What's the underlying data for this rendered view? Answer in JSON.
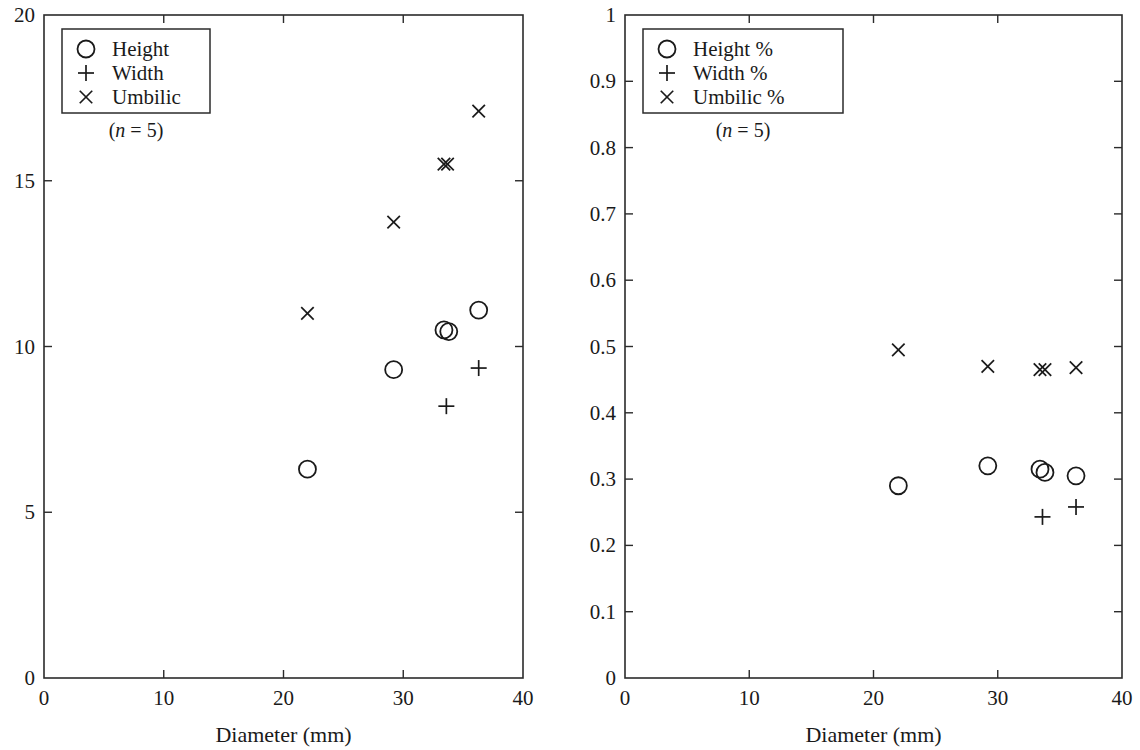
{
  "figure": {
    "background": "#ffffff",
    "ink_color": "#1a1a1a",
    "panel_count": 2
  },
  "chart_data": [
    {
      "panel": "left",
      "type": "scatter",
      "title": "",
      "xlabel": "Diameter (mm)",
      "ylabel": "",
      "xlim": [
        0,
        40
      ],
      "ylim": [
        0,
        20
      ],
      "xticks": [
        0,
        10,
        20,
        30,
        40
      ],
      "xticklabels": [
        "0",
        "10",
        "20",
        "30",
        "40"
      ],
      "yticks": [
        0,
        5,
        10,
        15,
        20
      ],
      "yticklabels": [
        "0",
        "5",
        "10",
        "15",
        "20"
      ],
      "grid": false,
      "legend_position": "upper-left",
      "annotation": "(n = 5)",
      "annotation_n": "5",
      "series": [
        {
          "name": "Height",
          "marker": "circle",
          "x": [
            22.0,
            29.2,
            33.4,
            33.8,
            36.3
          ],
          "y": [
            6.3,
            9.3,
            10.5,
            10.45,
            11.1
          ]
        },
        {
          "name": "Width",
          "marker": "plus",
          "x": [
            33.6,
            36.3
          ],
          "y": [
            8.2,
            9.35
          ]
        },
        {
          "name": "Umbilic",
          "marker": "cross",
          "x": [
            22.0,
            29.2,
            33.4,
            33.7,
            36.3
          ],
          "y": [
            11.0,
            13.75,
            15.5,
            15.5,
            17.1
          ]
        }
      ]
    },
    {
      "panel": "right",
      "type": "scatter",
      "title": "",
      "xlabel": "Diameter (mm)",
      "ylabel": "",
      "xlim": [
        0,
        40
      ],
      "ylim": [
        0,
        1
      ],
      "xticks": [
        0,
        10,
        20,
        30,
        40
      ],
      "xticklabels": [
        "0",
        "10",
        "20",
        "30",
        "40"
      ],
      "yticks": [
        0,
        0.1,
        0.2,
        0.3,
        0.4,
        0.5,
        0.6,
        0.7,
        0.8,
        0.9,
        1
      ],
      "yticklabels": [
        "0",
        "0.1",
        "0.2",
        "0.3",
        "0.4",
        "0.5",
        "0.6",
        "0.7",
        "0.8",
        "0.9",
        "1"
      ],
      "grid": false,
      "legend_position": "upper-left",
      "annotation": "(n = 5)",
      "annotation_n": "5",
      "series": [
        {
          "name": "Height %",
          "marker": "circle",
          "x": [
            22.0,
            29.2,
            33.4,
            33.8,
            36.3
          ],
          "y": [
            0.29,
            0.32,
            0.315,
            0.31,
            0.305
          ]
        },
        {
          "name": "Width %",
          "marker": "plus",
          "x": [
            33.6,
            36.3
          ],
          "y": [
            0.243,
            0.258
          ]
        },
        {
          "name": "Umbilic %",
          "marker": "cross",
          "x": [
            22.0,
            29.2,
            33.4,
            33.8,
            36.3
          ],
          "y": [
            0.495,
            0.47,
            0.465,
            0.465,
            0.468
          ]
        }
      ]
    }
  ]
}
